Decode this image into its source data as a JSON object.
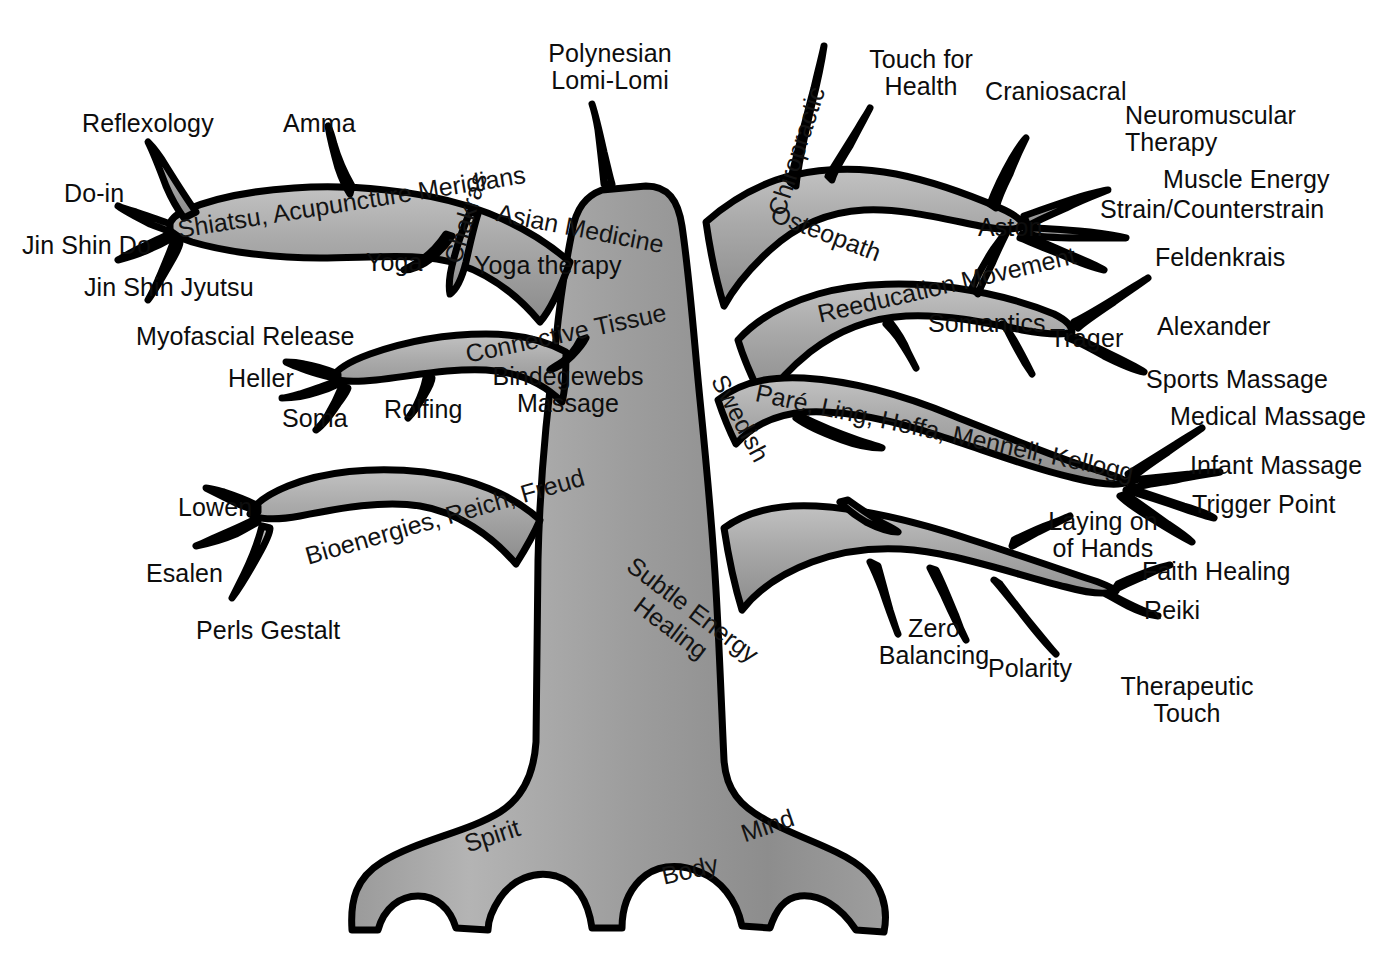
{
  "diagram": {
    "type": "concept-tree",
    "style": {
      "background": "#ffffff",
      "outline": "#000000",
      "limb_light": "#bdbdbd",
      "limb_mid": "#a6a6a6",
      "limb_dark": "#8a8a8a",
      "text": "#111111"
    }
  },
  "roots": [
    {
      "label": "Spirit",
      "rotate": -18
    },
    {
      "label": "Body",
      "rotate": -14
    },
    {
      "label": "Mind",
      "rotate": -20
    }
  ],
  "branches": [
    {
      "id": "asian-medicine",
      "trunk_label": "Shiatsu, Acupuncture Meridians  Asian Medicine",
      "on_limb": [
        {
          "text": "Shiatsu, Acupuncture Meridians",
          "rotate": -8
        },
        {
          "text": "Asian Medicine",
          "rotate": -10
        }
      ],
      "twigs": [
        "Reflexology",
        "Amma",
        "Do-in",
        "Jin Shin Do",
        "Jin Shin Jyutsu",
        "Chakras",
        "Yoga",
        "Yoga therapy"
      ]
    },
    {
      "id": "connective-tissue",
      "on_limb": [
        {
          "text": "Connective Tissue",
          "rotate": -12
        }
      ],
      "twigs": [
        "Myofascial Release",
        "Heller",
        "Soma",
        "Rolfing",
        "Bindegewebs Massage"
      ]
    },
    {
      "id": "bioenergies",
      "on_limb": [
        {
          "text": "Bioenergies, Reich, Freud",
          "rotate": -16
        }
      ],
      "twigs": [
        "Lowen",
        "Esalen",
        "Perls Gestalt"
      ]
    },
    {
      "id": "polynesian",
      "on_limb": [],
      "twigs": [
        "Polynesian Lomi-Lomi"
      ]
    },
    {
      "id": "osteopath",
      "on_limb": [
        {
          "text": "Chiropractic",
          "rotate": -74
        },
        {
          "text": "Osteopath",
          "rotate": 20
        }
      ],
      "twigs": [
        "Touch for Health",
        "Craniosacral",
        "Neuromuscular Therapy",
        "Muscle Energy",
        "Strain/Counterstrain"
      ]
    },
    {
      "id": "reeducation-movement",
      "on_limb": [
        {
          "text": "Reeducation Movement",
          "rotate": -12
        }
      ],
      "twigs": [
        "Aston",
        "Feldenkrais",
        "Somantics",
        "Trager",
        "Alexander"
      ]
    },
    {
      "id": "swedish",
      "on_limb": [
        {
          "text": "Swedish",
          "rotate": 62
        },
        {
          "text": "Paré, Ling, Hoffa, Mennell, Kellogg",
          "rotate": 10
        }
      ],
      "twigs": [
        "Sports Massage",
        "Medical Massage",
        "Infant Massage",
        "Trigger Point"
      ]
    },
    {
      "id": "subtle-energy-healing",
      "on_limb": [
        {
          "text": "Subtle Energy",
          "rotate": 36
        },
        {
          "text": "Healing",
          "rotate": 36
        }
      ],
      "twigs": [
        "Laying on of Hands",
        "Faith Healing",
        "Reiki",
        "Zero Balancing",
        "Polarity",
        "Therapeutic Touch"
      ]
    }
  ],
  "labels": {
    "reflexology": "Reflexology",
    "amma": "Amma",
    "doin": "Do-in",
    "jin_shin_do": "Jin Shin Do",
    "jin_shin_jyutsu": "Jin Shin Jyutsu",
    "yoga": "Yoga",
    "yoga_therapy": "Yoga therapy",
    "chakras": "Chakras",
    "shiatsu": "Shiatsu, Acupuncture Meridians",
    "asian_medicine": "Asian Medicine",
    "polynesian": "Polynesian\nLomi-Lomi",
    "chiropractic": "Chiropractic",
    "osteopath": "Osteopath",
    "touch_for_health": "Touch for\nHealth",
    "craniosacral": "Craniosacral",
    "neuromuscular": "Neuromuscular\nTherapy",
    "muscle_energy": "Muscle Energy",
    "strain": "Strain/Counterstrain",
    "aston": "Aston",
    "feldenkrais": "Feldenkrais",
    "reeducation": "Reeducation Movement",
    "somantics": "Somantics",
    "trager": "Trager",
    "alexander": "Alexander",
    "myofascial": "Myofascial Release",
    "heller": "Heller",
    "soma": "Soma",
    "rolfing": "Rolfing",
    "connective_tissue": "Connective Tissue",
    "bindegewebs": "Bindegewebs\nMassage",
    "swedish": "Swedish",
    "pare": "Paré, Ling, Hoffa, Mennell, Kellogg",
    "sports_massage": "Sports Massage",
    "medical_massage": "Medical Massage",
    "infant_massage": "Infant Massage",
    "trigger_point": "Trigger Point",
    "lowen": "Lowen",
    "esalen": "Esalen",
    "perls": "Perls Gestalt",
    "bioenergies": "Bioenergies, Reich, Freud",
    "subtle1": "Subtle Energy",
    "subtle2": "Healing",
    "laying_on": "Laying on\nof Hands",
    "faith_healing": "Faith Healing",
    "reiki": "Reiki",
    "zero_balancing": "Zero\nBalancing",
    "polarity": "Polarity",
    "therapeutic_touch": "Therapeutic\nTouch",
    "spirit": "Spirit",
    "body": "Body",
    "mind": "Mind"
  }
}
